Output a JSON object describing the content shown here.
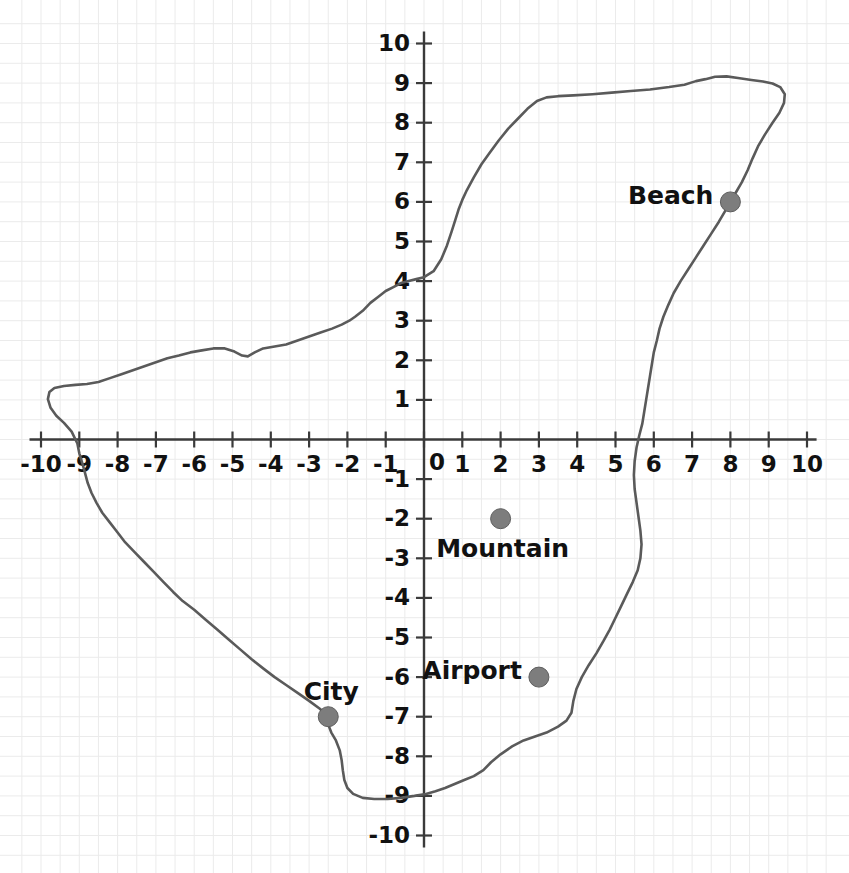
{
  "figure": {
    "width": 849,
    "height": 873,
    "background_color": "#ffffff"
  },
  "chart_data": {
    "type": "line",
    "title": "",
    "subtitle": "",
    "xlabel": "",
    "ylabel": "",
    "xlim": [
      -10,
      10
    ],
    "ylim": [
      -10,
      10
    ],
    "grid": true,
    "grid_color": "#ebebeb",
    "legend": "none",
    "axis_color": "#3a3a3a",
    "axis_style": "centered-cartesian-spines",
    "x_ticks": [
      -10,
      -9,
      -8,
      -7,
      -6,
      -5,
      -4,
      -3,
      -2,
      -1,
      0,
      1,
      2,
      3,
      4,
      5,
      6,
      7,
      8,
      9,
      10
    ],
    "y_ticks": [
      -10,
      -9,
      -8,
      -7,
      -6,
      -5,
      -4,
      -3,
      -2,
      -1,
      1,
      2,
      3,
      4,
      5,
      6,
      7,
      8,
      9,
      10
    ],
    "x_tick_labels": [
      "-10",
      "-9",
      "-8",
      "-7",
      "-6",
      "-5",
      "-4",
      "-3",
      "-2",
      "-1",
      "0",
      "1",
      "2",
      "3",
      "4",
      "5",
      "6",
      "7",
      "8",
      "9",
      "10"
    ],
    "y_tick_labels": [
      "-10",
      "-9",
      "-8",
      "-7",
      "-6",
      "-5",
      "-4",
      "-3",
      "-2",
      "-1",
      "1",
      "2",
      "3",
      "4",
      "5",
      "6",
      "7",
      "8",
      "9",
      "10"
    ],
    "series": [
      {
        "name": "coastline",
        "kind": "closed-outline",
        "color": "#5a5a5a",
        "line_width": 2.6,
        "points": [
          [
            0.0,
            4.1
          ],
          [
            0.25,
            4.25
          ],
          [
            0.45,
            4.55
          ],
          [
            0.6,
            4.9
          ],
          [
            0.72,
            5.25
          ],
          [
            0.82,
            5.55
          ],
          [
            0.9,
            5.8
          ],
          [
            1.0,
            6.05
          ],
          [
            1.12,
            6.3
          ],
          [
            1.3,
            6.62
          ],
          [
            1.5,
            6.95
          ],
          [
            1.72,
            7.25
          ],
          [
            1.95,
            7.55
          ],
          [
            2.2,
            7.85
          ],
          [
            2.45,
            8.1
          ],
          [
            2.7,
            8.35
          ],
          [
            2.95,
            8.55
          ],
          [
            3.2,
            8.64
          ],
          [
            3.5,
            8.67
          ],
          [
            3.9,
            8.69
          ],
          [
            4.4,
            8.72
          ],
          [
            4.9,
            8.76
          ],
          [
            5.4,
            8.8
          ],
          [
            5.9,
            8.84
          ],
          [
            6.4,
            8.9
          ],
          [
            6.8,
            8.96
          ],
          [
            7.1,
            9.05
          ],
          [
            7.35,
            9.1
          ],
          [
            7.6,
            9.16
          ],
          [
            7.9,
            9.17
          ],
          [
            8.2,
            9.13
          ],
          [
            8.55,
            9.08
          ],
          [
            8.85,
            9.04
          ],
          [
            9.1,
            8.99
          ],
          [
            9.3,
            8.9
          ],
          [
            9.42,
            8.72
          ],
          [
            9.4,
            8.5
          ],
          [
            9.28,
            8.25
          ],
          [
            9.1,
            8.0
          ],
          [
            8.9,
            7.7
          ],
          [
            8.72,
            7.4
          ],
          [
            8.58,
            7.1
          ],
          [
            8.45,
            6.8
          ],
          [
            8.3,
            6.5
          ],
          [
            8.15,
            6.25
          ],
          [
            8.0,
            6.0
          ],
          [
            7.85,
            5.75
          ],
          [
            7.7,
            5.5
          ],
          [
            7.5,
            5.2
          ],
          [
            7.3,
            4.9
          ],
          [
            7.1,
            4.6
          ],
          [
            6.9,
            4.3
          ],
          [
            6.7,
            4.0
          ],
          [
            6.52,
            3.7
          ],
          [
            6.38,
            3.4
          ],
          [
            6.25,
            3.1
          ],
          [
            6.15,
            2.8
          ],
          [
            6.08,
            2.5
          ],
          [
            6.0,
            2.2
          ],
          [
            5.95,
            1.9
          ],
          [
            5.9,
            1.6
          ],
          [
            5.85,
            1.3
          ],
          [
            5.8,
            1.0
          ],
          [
            5.75,
            0.7
          ],
          [
            5.7,
            0.4
          ],
          [
            5.62,
            0.1
          ],
          [
            5.55,
            -0.2
          ],
          [
            5.5,
            -0.55
          ],
          [
            5.48,
            -0.9
          ],
          [
            5.5,
            -1.25
          ],
          [
            5.55,
            -1.6
          ],
          [
            5.6,
            -1.95
          ],
          [
            5.65,
            -2.3
          ],
          [
            5.68,
            -2.65
          ],
          [
            5.65,
            -3.0
          ],
          [
            5.58,
            -3.3
          ],
          [
            5.45,
            -3.6
          ],
          [
            5.3,
            -3.9
          ],
          [
            5.15,
            -4.2
          ],
          [
            5.0,
            -4.5
          ],
          [
            4.85,
            -4.8
          ],
          [
            4.68,
            -5.1
          ],
          [
            4.5,
            -5.4
          ],
          [
            4.3,
            -5.7
          ],
          [
            4.12,
            -6.0
          ],
          [
            3.98,
            -6.3
          ],
          [
            3.9,
            -6.6
          ],
          [
            3.85,
            -6.9
          ],
          [
            3.72,
            -7.1
          ],
          [
            3.5,
            -7.25
          ],
          [
            3.2,
            -7.4
          ],
          [
            2.9,
            -7.5
          ],
          [
            2.6,
            -7.6
          ],
          [
            2.3,
            -7.75
          ],
          [
            2.0,
            -7.95
          ],
          [
            1.75,
            -8.15
          ],
          [
            1.55,
            -8.35
          ],
          [
            1.3,
            -8.5
          ],
          [
            1.05,
            -8.6
          ],
          [
            0.8,
            -8.7
          ],
          [
            0.55,
            -8.8
          ],
          [
            0.3,
            -8.88
          ],
          [
            0.05,
            -8.95
          ],
          [
            -0.25,
            -9.0
          ],
          [
            -0.6,
            -9.05
          ],
          [
            -0.95,
            -9.08
          ],
          [
            -1.3,
            -9.08
          ],
          [
            -1.6,
            -9.05
          ],
          [
            -1.85,
            -8.95
          ],
          [
            -2.0,
            -8.8
          ],
          [
            -2.08,
            -8.6
          ],
          [
            -2.12,
            -8.35
          ],
          [
            -2.15,
            -8.1
          ],
          [
            -2.2,
            -7.85
          ],
          [
            -2.3,
            -7.6
          ],
          [
            -2.42,
            -7.4
          ],
          [
            -2.5,
            -7.2
          ],
          [
            -2.5,
            -7.0
          ],
          [
            -2.72,
            -6.8
          ],
          [
            -3.0,
            -6.6
          ],
          [
            -3.3,
            -6.4
          ],
          [
            -3.6,
            -6.2
          ],
          [
            -3.9,
            -6.0
          ],
          [
            -4.2,
            -5.78
          ],
          [
            -4.5,
            -5.55
          ],
          [
            -4.8,
            -5.3
          ],
          [
            -5.1,
            -5.05
          ],
          [
            -5.4,
            -4.8
          ],
          [
            -5.7,
            -4.55
          ],
          [
            -6.0,
            -4.3
          ],
          [
            -6.3,
            -4.08
          ],
          [
            -6.55,
            -3.85
          ],
          [
            -6.8,
            -3.6
          ],
          [
            -7.05,
            -3.35
          ],
          [
            -7.3,
            -3.1
          ],
          [
            -7.55,
            -2.85
          ],
          [
            -7.8,
            -2.6
          ],
          [
            -8.0,
            -2.35
          ],
          [
            -8.2,
            -2.1
          ],
          [
            -8.4,
            -1.85
          ],
          [
            -8.55,
            -1.6
          ],
          [
            -8.68,
            -1.35
          ],
          [
            -8.78,
            -1.1
          ],
          [
            -8.85,
            -0.85
          ],
          [
            -8.92,
            -0.6
          ],
          [
            -9.0,
            -0.35
          ],
          [
            -9.05,
            -0.1
          ],
          [
            -9.2,
            0.2
          ],
          [
            -9.4,
            0.42
          ],
          [
            -9.6,
            0.6
          ],
          [
            -9.75,
            0.8
          ],
          [
            -9.82,
            1.02
          ],
          [
            -9.78,
            1.2
          ],
          [
            -9.65,
            1.3
          ],
          [
            -9.4,
            1.35
          ],
          [
            -9.1,
            1.38
          ],
          [
            -8.8,
            1.4
          ],
          [
            -8.5,
            1.45
          ],
          [
            -8.2,
            1.55
          ],
          [
            -7.9,
            1.65
          ],
          [
            -7.6,
            1.75
          ],
          [
            -7.3,
            1.85
          ],
          [
            -7.0,
            1.95
          ],
          [
            -6.7,
            2.05
          ],
          [
            -6.4,
            2.12
          ],
          [
            -6.1,
            2.2
          ],
          [
            -5.8,
            2.25
          ],
          [
            -5.5,
            2.3
          ],
          [
            -5.2,
            2.3
          ],
          [
            -4.95,
            2.22
          ],
          [
            -4.75,
            2.12
          ],
          [
            -4.6,
            2.1
          ],
          [
            -4.42,
            2.2
          ],
          [
            -4.2,
            2.3
          ],
          [
            -3.9,
            2.35
          ],
          [
            -3.6,
            2.4
          ],
          [
            -3.3,
            2.5
          ],
          [
            -3.0,
            2.6
          ],
          [
            -2.7,
            2.7
          ],
          [
            -2.4,
            2.8
          ],
          [
            -2.15,
            2.9
          ],
          [
            -1.95,
            3.0
          ],
          [
            -1.8,
            3.1
          ],
          [
            -1.6,
            3.25
          ],
          [
            -1.4,
            3.45
          ],
          [
            -1.2,
            3.6
          ],
          [
            -1.0,
            3.75
          ],
          [
            -0.8,
            3.85
          ],
          [
            -0.6,
            3.95
          ],
          [
            -0.4,
            4.0
          ],
          [
            -0.2,
            4.05
          ],
          [
            0.0,
            4.1
          ]
        ]
      }
    ],
    "points_of_interest": [
      {
        "label": "Beach",
        "x": 8,
        "y": 6,
        "marker": "circle",
        "marker_color": "#7d7d7d",
        "label_position": "left"
      },
      {
        "label": "Mountain",
        "x": 2,
        "y": -2,
        "marker": "circle",
        "marker_color": "#7d7d7d",
        "label_position": "below"
      },
      {
        "label": "Airport",
        "x": 3,
        "y": -6,
        "marker": "circle",
        "marker_color": "#7d7d7d",
        "label_position": "left"
      },
      {
        "label": "City",
        "x": -2.5,
        "y": -7,
        "marker": "circle",
        "marker_color": "#7d7d7d",
        "label_position": "above-right"
      }
    ]
  }
}
